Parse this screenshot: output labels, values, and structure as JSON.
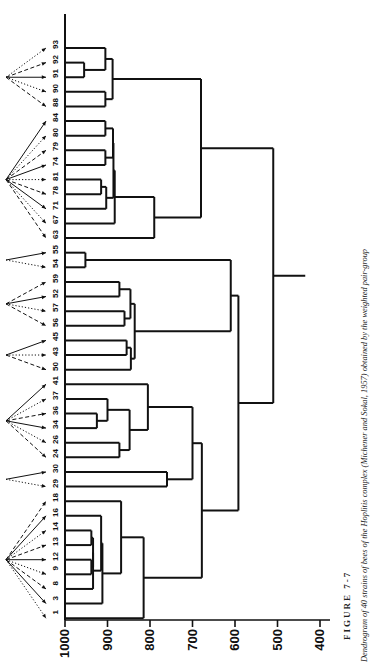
{
  "figure": {
    "number_label": "FIGURE 7-7",
    "caption": "Dendrogram of 40 strains of bees of the Hoplitis complex (Michener and Sokal, 1957) obtained by the weighted pair-group",
    "ink_color": "#111111",
    "background_color": "#ffffff"
  },
  "axis": {
    "title": "",
    "tick_labels": [
      "1000",
      "900",
      "800",
      "700",
      "600",
      "500",
      "400"
    ],
    "orientation": "horizontal-reversed",
    "min": 400,
    "max": 1000
  },
  "leaves": [
    {
      "label": "93"
    },
    {
      "label": "92"
    },
    {
      "label": "91"
    },
    {
      "label": "90"
    },
    {
      "label": "88"
    },
    {
      "label": "84"
    },
    {
      "label": "80"
    },
    {
      "label": "79"
    },
    {
      "label": "74"
    },
    {
      "label": "81"
    },
    {
      "label": "78"
    },
    {
      "label": "71"
    },
    {
      "label": "67"
    },
    {
      "label": "63"
    },
    {
      "label": "55"
    },
    {
      "label": "54"
    },
    {
      "label": "59"
    },
    {
      "label": "52"
    },
    {
      "label": "57"
    },
    {
      "label": "56"
    },
    {
      "label": "45"
    },
    {
      "label": "43"
    },
    {
      "label": "50"
    },
    {
      "label": "41"
    },
    {
      "label": "37"
    },
    {
      "label": "36"
    },
    {
      "label": "34"
    },
    {
      "label": "26"
    },
    {
      "label": "24"
    },
    {
      "label": "30"
    },
    {
      "label": "29"
    },
    {
      "label": "18"
    },
    {
      "label": "16"
    },
    {
      "label": "14"
    },
    {
      "label": "13"
    },
    {
      "label": "12"
    },
    {
      "label": "9"
    },
    {
      "label": "8"
    },
    {
      "label": "3"
    },
    {
      "label": "1"
    }
  ],
  "pointer_groups": [
    {
      "name": "group-93-88",
      "first_leaf": 0,
      "last_leaf": 4
    },
    {
      "name": "group-84-63",
      "first_leaf": 5,
      "last_leaf": 13
    },
    {
      "name": "group-55-54",
      "first_leaf": 14,
      "last_leaf": 15
    },
    {
      "name": "group-59-56",
      "first_leaf": 16,
      "last_leaf": 19
    },
    {
      "name": "group-45-50",
      "first_leaf": 20,
      "last_leaf": 22
    },
    {
      "name": "group-41-24",
      "first_leaf": 23,
      "last_leaf": 28
    },
    {
      "name": "group-30-29",
      "first_leaf": 29,
      "last_leaf": 30
    },
    {
      "name": "group-18-1",
      "first_leaf": 31,
      "last_leaf": 39
    }
  ],
  "chart_data": {
    "type": "dendrogram",
    "title": "Dendrogram of 40 strains of bees of the Hoplitis complex",
    "xlabel": "",
    "ylabel": "",
    "axis_values": [
      1000,
      900,
      800,
      700,
      600,
      500,
      400
    ],
    "axis_direction": "decreasing-left-to-right",
    "leaf_order": [
      "93",
      "92",
      "91",
      "90",
      "88",
      "84",
      "80",
      "79",
      "74",
      "81",
      "78",
      "71",
      "67",
      "63",
      "55",
      "54",
      "59",
      "52",
      "57",
      "56",
      "45",
      "43",
      "50",
      "41",
      "37",
      "36",
      "34",
      "26",
      "24",
      "30",
      "29",
      "18",
      "16",
      "14",
      "13",
      "12",
      "9",
      "8",
      "3",
      "1"
    ],
    "merges": [
      {
        "id": "m1",
        "left": "92",
        "right": "91",
        "height": 955
      },
      {
        "id": "m2",
        "left": "93",
        "right": "m1",
        "height": 905
      },
      {
        "id": "m3",
        "left": "90",
        "right": "88",
        "height": 905
      },
      {
        "id": "m4",
        "left": "m2",
        "right": "m3",
        "height": 888
      },
      {
        "id": "m5",
        "left": "84",
        "right": "80",
        "height": 905
      },
      {
        "id": "m6",
        "left": "79",
        "right": "74",
        "height": 905
      },
      {
        "id": "m7",
        "left": "m5",
        "right": "m6",
        "height": 887
      },
      {
        "id": "m8",
        "left": "81",
        "right": "78",
        "height": 915
      },
      {
        "id": "m9",
        "left": "m8",
        "right": "71",
        "height": 903
      },
      {
        "id": "m10",
        "left": "m7",
        "right": "m9",
        "height": 886
      },
      {
        "id": "m11",
        "left": "m10",
        "right": "67",
        "height": 883
      },
      {
        "id": "m12",
        "left": "m11",
        "right": "63",
        "height": 790
      },
      {
        "id": "m13",
        "left": "m4",
        "right": "m12",
        "height": 680
      },
      {
        "id": "m14",
        "left": "55",
        "right": "54",
        "height": 952
      },
      {
        "id": "m15",
        "left": "59",
        "right": "52",
        "height": 872
      },
      {
        "id": "m16",
        "left": "57",
        "right": "56",
        "height": 860
      },
      {
        "id": "m17",
        "left": "m15",
        "right": "m16",
        "height": 846
      },
      {
        "id": "m18",
        "left": "45",
        "right": "43",
        "height": 855
      },
      {
        "id": "m19",
        "left": "m18",
        "right": "50",
        "height": 845
      },
      {
        "id": "m20",
        "left": "m17",
        "right": "m19",
        "height": 836
      },
      {
        "id": "m21",
        "left": "m14",
        "right": "m20",
        "height": 610
      },
      {
        "id": "m22",
        "left": "36",
        "right": "34",
        "height": 925
      },
      {
        "id": "m23",
        "left": "37",
        "right": "m22",
        "height": 900
      },
      {
        "id": "m24",
        "left": "26",
        "right": "24",
        "height": 872
      },
      {
        "id": "m25",
        "left": "m23",
        "right": "m24",
        "height": 848
      },
      {
        "id": "m26",
        "left": "m25",
        "right": "41",
        "height": 805
      },
      {
        "id": "m27",
        "left": "30",
        "right": "29",
        "height": 760
      },
      {
        "id": "m28",
        "left": "m26",
        "right": "m27",
        "height": 700
      },
      {
        "id": "m29",
        "left": "14",
        "right": "13",
        "height": 938
      },
      {
        "id": "m30",
        "left": "12",
        "right": "9",
        "height": 938
      },
      {
        "id": "m31",
        "left": "m29",
        "right": "m30",
        "height": 934
      },
      {
        "id": "m32",
        "left": "m31",
        "right": "8",
        "height": 934
      },
      {
        "id": "m33",
        "left": "m32",
        "right": "16",
        "height": 915
      },
      {
        "id": "m34",
        "left": "m33",
        "right": "3",
        "height": 912
      },
      {
        "id": "m35",
        "left": "m34",
        "right": "18",
        "height": 868
      },
      {
        "id": "m36",
        "left": "m35",
        "right": "1",
        "height": 815
      },
      {
        "id": "m37",
        "left": "m28",
        "right": "m36",
        "height": 678
      },
      {
        "id": "m38",
        "left": "m21",
        "right": "m37",
        "height": 592
      },
      {
        "id": "m39",
        "left": "m13",
        "right": "m38",
        "height": 510
      }
    ]
  }
}
